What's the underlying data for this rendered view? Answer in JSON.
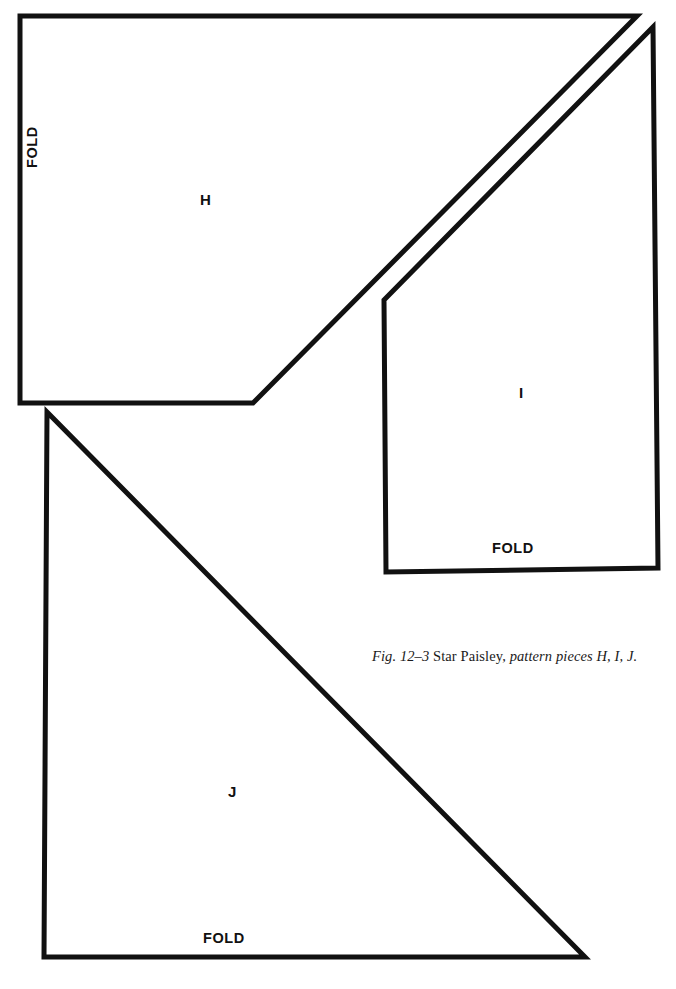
{
  "figure": {
    "caption": {
      "number": "Fig. 12–3",
      "title": "Star Paisley,",
      "detail": "pattern pieces H, I, J."
    },
    "colors": {
      "outline": "#111111",
      "background": "#ffffff",
      "text": "#111111"
    },
    "pieces": [
      {
        "id": "h",
        "label": "H",
        "shape": "pentagon",
        "fold_label": "FOLD",
        "fold_edge": "left",
        "points": "20,16 637,16 253,403 20,403"
      },
      {
        "id": "i",
        "label": "I",
        "shape": "pentagon",
        "fold_label": "FOLD",
        "fold_edge": "bottom",
        "points": "653,27 384,300 386,572 658,568"
      },
      {
        "id": "j",
        "label": "J",
        "shape": "right-triangle",
        "fold_label": "FOLD",
        "fold_edge": "bottom",
        "points": "47,412 585,957 44,957"
      }
    ]
  }
}
